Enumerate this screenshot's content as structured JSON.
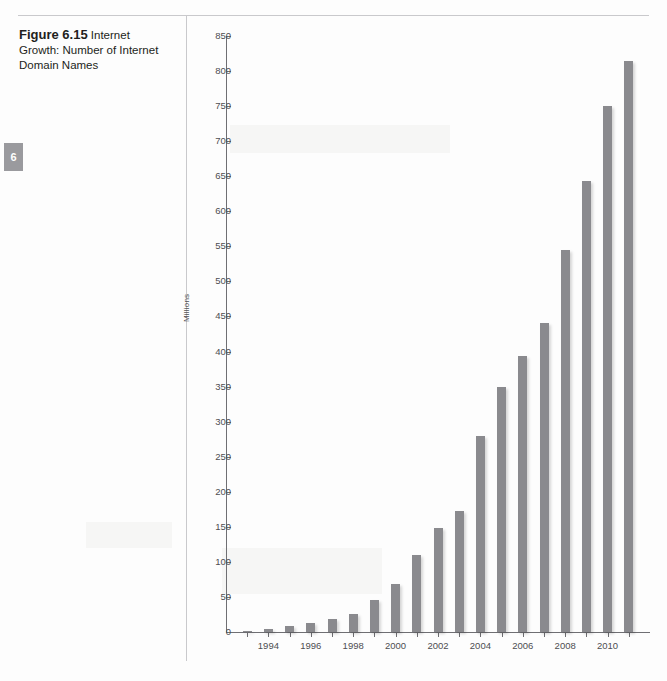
{
  "page": {
    "running_head": "",
    "chapter_tab": "6",
    "caption": {
      "label": "Figure 6.15",
      "text": " Internet Growth: Number of Internet Domain Names"
    }
  },
  "chart_data": {
    "type": "bar",
    "title": "Internet Growth: Number of Internet Domain Names",
    "xlabel": "",
    "ylabel": "Millions",
    "ylim": [
      0,
      850
    ],
    "ytick_step": 50,
    "grid": false,
    "legend": null,
    "bar_color": "#8a8a8e",
    "categories": [
      "1993",
      "1994",
      "1995",
      "1996",
      "1997",
      "1998",
      "1999",
      "2000",
      "2001",
      "2002",
      "2003",
      "2004",
      "2005",
      "2006",
      "2007",
      "2008",
      "2009",
      "2010",
      "2011"
    ],
    "values": [
      2,
      4,
      9,
      13,
      19,
      26,
      45,
      68,
      110,
      148,
      172,
      280,
      350,
      393,
      440,
      545,
      643,
      750,
      815
    ],
    "xtick_labels": [
      "",
      "1994",
      "",
      "1996",
      "",
      "1998",
      "",
      "2000",
      "",
      "2002",
      "",
      "2004",
      "",
      "2006",
      "",
      "2008",
      "",
      "2010",
      ""
    ],
    "ytick_labels": [
      "0",
      "50",
      "100",
      "150",
      "200",
      "250",
      "300",
      "350",
      "400",
      "450",
      "500",
      "550",
      "600",
      "650",
      "700",
      "750",
      "800",
      "850"
    ]
  }
}
